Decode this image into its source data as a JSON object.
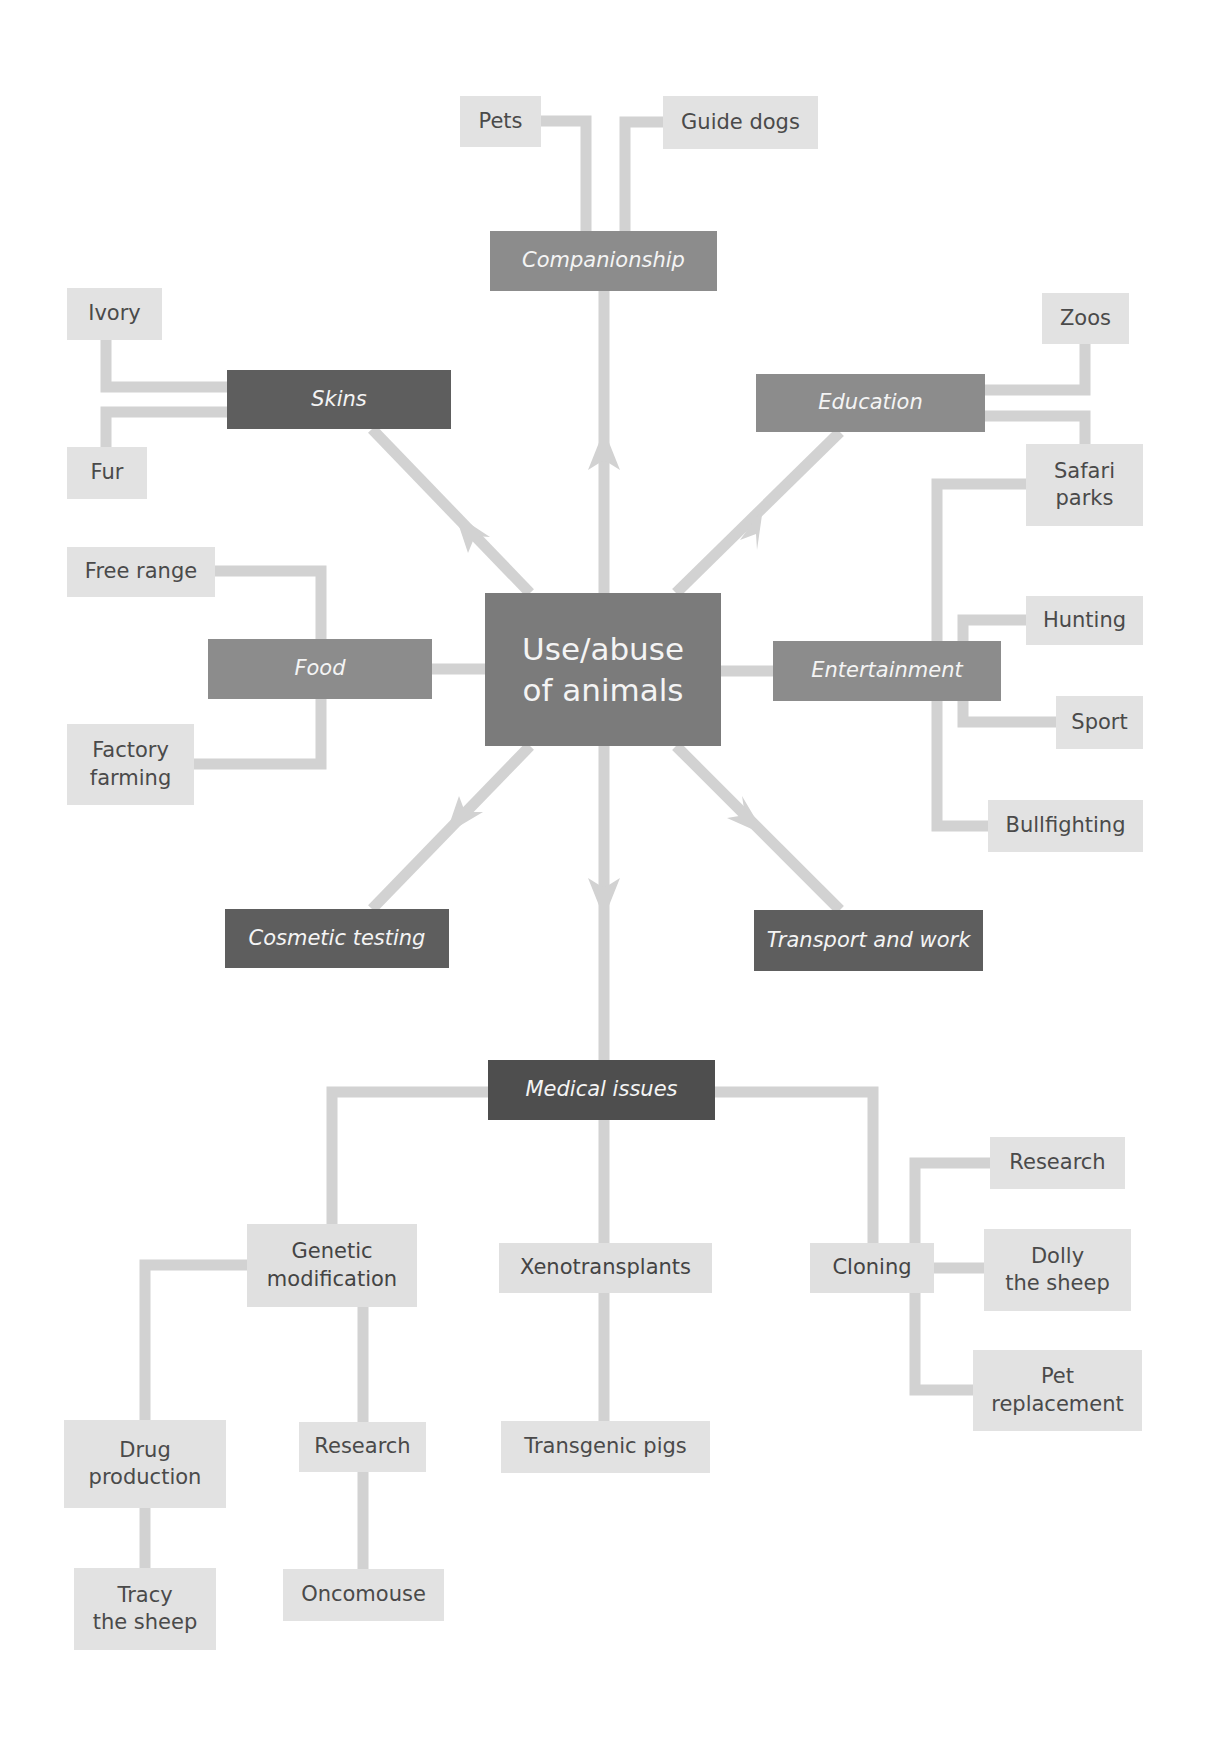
{
  "diagram": {
    "center": {
      "label": "Use/abuse\nof animals"
    },
    "categories": {
      "companionship": {
        "label": "Companionship",
        "children": [
          "Pets",
          "Guide dogs"
        ]
      },
      "skins": {
        "label": "Skins",
        "children": [
          "Ivory",
          "Fur"
        ]
      },
      "education": {
        "label": "Education",
        "children": [
          "Zoos",
          "Safari\nparks"
        ]
      },
      "food": {
        "label": "Food",
        "children": [
          "Free range",
          "Factory\nfarming"
        ]
      },
      "entertainment": {
        "label": "Entertainment",
        "children": [
          "Hunting",
          "Sport",
          "Bullfighting",
          "Safari\nparks"
        ]
      },
      "cosmetic_testing": {
        "label": "Cosmetic testing"
      },
      "transport_work": {
        "label": "Transport and work"
      },
      "medical": {
        "label": "Medical issues"
      }
    },
    "leaves": {
      "pets": "Pets",
      "guide_dogs": "Guide dogs",
      "ivory": "Ivory",
      "fur": "Fur",
      "zoos": "Zoos",
      "safari_parks": "Safari\nparks",
      "free_range": "Free range",
      "factory_farming": "Factory\nfarming",
      "hunting": "Hunting",
      "sport": "Sport",
      "bullfighting": "Bullfighting"
    },
    "medical": {
      "genetic_modification": "Genetic\nmodification",
      "xenotransplants": "Xenotransplants",
      "cloning": "Cloning",
      "clone_research": "Research",
      "dolly": "Dolly\nthe sheep",
      "pet_replacement": "Pet\nreplacement",
      "drug_production": "Drug\nproduction",
      "gm_research": "Research",
      "transgenic_pigs": "Transgenic pigs",
      "tracy": "Tracy\nthe sheep",
      "oncomouse": "Oncomouse"
    },
    "colors": {
      "connector": "#d2d2d2",
      "leaf_box": "#e2e2e2",
      "category_mid": "#8c8c8c",
      "category_dark": "#5e5e5e",
      "center_box": "#7b7b7b",
      "medical_box": "#4e4e4e"
    }
  }
}
